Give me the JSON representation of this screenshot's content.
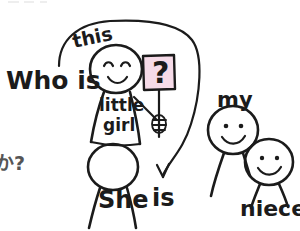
{
  "scene": {
    "title": "Who is this little girl? She is my niece.",
    "medium": "hand-drawn-sketch",
    "background_color": "#ffffff",
    "ink_color": "#1b1b1b",
    "accent_color": "#f6dbe8"
  },
  "texts": {
    "top_cutoff": "",
    "question_lead": "Who is",
    "label_this": "this",
    "label_little_girl_line1": "little",
    "label_little_girl_line2": "girl",
    "sign_symbol": "?",
    "answer_she": "She",
    "answer_is": "is",
    "label_my": "my",
    "label_niece": "niece",
    "japanese_cutoff": "か?"
  },
  "figures": [
    {
      "name": "little-girl",
      "label": "little girl",
      "expression": "smiling",
      "eyes": "curved",
      "holds": "question-sign"
    },
    {
      "name": "she-figure",
      "label": "She",
      "expression": "blank",
      "eyes": "none",
      "holds": "none"
    },
    {
      "name": "my-figure",
      "label": "my",
      "expression": "smiling",
      "eyes": "dots",
      "holds": "none"
    },
    {
      "name": "niece-figure",
      "label": "niece",
      "expression": "smiling",
      "eyes": "dots",
      "holds": "none"
    }
  ],
  "annotations": {
    "arc_from": "Who is",
    "arc_to": "is",
    "arrow_head": "down"
  }
}
